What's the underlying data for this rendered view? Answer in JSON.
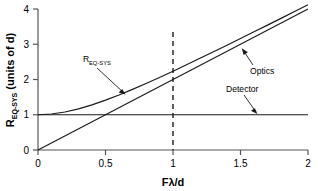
{
  "chart_data": {
    "type": "line",
    "title": "",
    "xlabel": "Fλ/d",
    "ylabel": "R_EQ-SYS (units of d)",
    "ylabel_main": "R",
    "ylabel_sub": "EQ-SYS",
    "ylabel_tail": " (units of d)",
    "xlabel_main": "Fλ/d",
    "xlim": [
      0,
      2
    ],
    "ylim": [
      0,
      4
    ],
    "grid": false,
    "legend_position": "inline-annotations",
    "xticks": [
      0,
      0.5,
      1,
      1.5,
      2
    ],
    "xticklabels": [
      "0",
      "0.5",
      "1",
      "1.5",
      "2"
    ],
    "yticks": [
      0,
      1,
      2,
      3,
      4
    ],
    "yticklabels": [
      "0",
      "1",
      "2",
      "3",
      "4"
    ],
    "series": [
      {
        "name": "R_EQ-SYS",
        "description": "root-sum-square of detector and optics blur",
        "x": [
          0,
          0.1,
          0.2,
          0.3,
          0.4,
          0.5,
          0.6,
          0.7,
          0.8,
          0.9,
          1.0,
          1.1,
          1.2,
          1.3,
          1.4,
          1.5,
          1.6,
          1.7,
          1.8,
          1.9,
          2.0
        ],
        "values": [
          1.0,
          1.02,
          1.077,
          1.166,
          1.281,
          1.414,
          1.562,
          1.72,
          1.887,
          2.059,
          2.236,
          2.417,
          2.6,
          2.785,
          2.973,
          3.162,
          3.352,
          3.542,
          3.734,
          3.926,
          4.123
        ]
      },
      {
        "name": "Optics",
        "description": "optics blur, linear with F-lambda/d",
        "x": [
          0,
          2
        ],
        "values": [
          0,
          4.0
        ]
      },
      {
        "name": "Detector",
        "description": "detector footprint, constant at 1 d",
        "x": [
          0,
          2
        ],
        "values": [
          1.0,
          1.0
        ]
      }
    ],
    "annotations": [
      {
        "name": "R_EQ-SYS",
        "text": "R",
        "subscript": "EQ-SYS",
        "points_to": [
          0.62,
          1.62
        ]
      },
      {
        "name": "Optics",
        "text": "Optics",
        "points_to": [
          1.6,
          3.3
        ]
      },
      {
        "name": "Detector",
        "text": "Detector",
        "points_to": [
          1.62,
          1.0
        ]
      }
    ],
    "reference_lines": [
      {
        "name": "unity-marker",
        "orientation": "vertical",
        "x": 1,
        "style": "dashed",
        "y_from": 0,
        "y_to": 3.4
      }
    ],
    "colors": {
      "curve": "#1a1a1a",
      "axis": "#555555",
      "background": "#ffffff"
    }
  }
}
